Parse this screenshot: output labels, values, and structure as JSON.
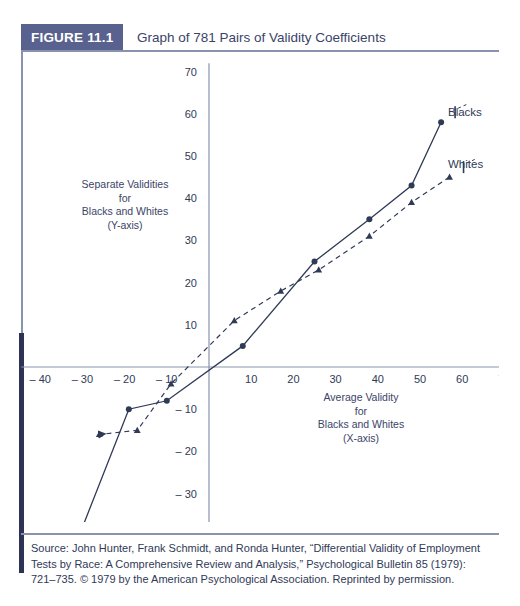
{
  "figure": {
    "tab_label": "FIGURE 11.1",
    "title": "Graph of 781 Pairs of Validity Coefficients",
    "source_note": "Source: John Hunter, Frank Schmidt, and Ronda Hunter, “Differential Validity of Employment Tests by Race: A Comprehensive Review and Analysis,” Psychological Bulletin 85 (1979): 721–735. © 1979 by the American Psychological Association. Reprinted by permission.",
    "accent_color": "#59628e",
    "line_color": "#2f3a57",
    "axis_color": "#8a93ad",
    "text_color": "#2f3a57"
  },
  "captions": {
    "y_axis": "Separate Validities\nfor\nBlacks and Whites\n(Y-axis)",
    "x_axis": "Average Validity\nfor\nBlacks and Whites\n(X-axis)"
  },
  "chart_data": {
    "type": "line",
    "title": "Graph of 781 Pairs of Validity Coefficients",
    "xlabel": "Average Validity for Blacks and Whites (X-axis)",
    "ylabel": "Separate Validities for Blacks and Whites (Y-axis)",
    "xlim": [
      -45,
      72
    ],
    "ylim": [
      -43,
      72
    ],
    "grid": false,
    "legend_position": "right-inline",
    "xticks": [
      -40,
      -30,
      -20,
      -10,
      10,
      20,
      30,
      40,
      50,
      60,
      70
    ],
    "yticks": [
      -40,
      -30,
      -20,
      -10,
      10,
      20,
      30,
      40,
      50,
      60,
      70
    ],
    "xtick_labels": [
      "– 40",
      "– 30",
      "– 20",
      "– 10",
      "10",
      "20",
      "30",
      "40",
      "50",
      "60",
      "70"
    ],
    "ytick_labels": [
      "– 40",
      "– 30",
      "– 20",
      "– 10",
      "10",
      "20",
      "30",
      "40",
      "50",
      "60",
      "70"
    ],
    "series": [
      {
        "name": "Blacks",
        "style": "solid",
        "marker": "circle",
        "points": [
          [
            -30,
            -38
          ],
          [
            -19,
            -10
          ],
          [
            -10,
            -8
          ],
          [
            8,
            5
          ],
          [
            25,
            25
          ],
          [
            38,
            35
          ],
          [
            48,
            43
          ],
          [
            55,
            58
          ]
        ]
      },
      {
        "name": "Whites",
        "style": "dashed",
        "marker": "triangle",
        "arrow_end": "left",
        "points": [
          [
            -26,
            -16
          ],
          [
            -17,
            -15
          ],
          [
            -9,
            -4
          ],
          [
            6,
            11
          ],
          [
            17,
            18
          ],
          [
            26,
            23
          ],
          [
            38,
            31
          ],
          [
            48,
            39
          ],
          [
            57,
            45
          ]
        ]
      }
    ]
  }
}
